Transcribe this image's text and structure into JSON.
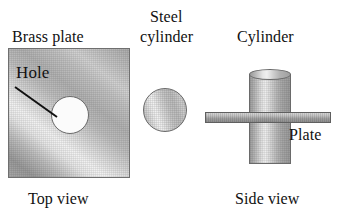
{
  "figure": {
    "background_color": "#ffffff"
  },
  "top_view": {
    "plate_label": "Brass plate",
    "hole_label": "Hole",
    "view_label": "Top view",
    "plate_fill": "#c4c4c4",
    "plate_outline": "#6f6f6f",
    "hole_fill": "#fbfbfb",
    "hole_outline": "#6a6a6a",
    "plate_rect": {
      "x": 8,
      "y": 48,
      "width": 122,
      "height": 130
    },
    "hole_circle": {
      "cx": 69,
      "cy": 114,
      "d": 38
    },
    "leader_line": {
      "x1": 10,
      "y1": 38,
      "x2": 50,
      "y2": 68
    }
  },
  "middle": {
    "cylinder_label_line1": "Steel",
    "cylinder_label_line2": "cylinder",
    "cylinder_circle": {
      "cx": 165,
      "cy": 110,
      "d": 44
    },
    "cylinder_fill": "#d0d0d0",
    "cylinder_outline": "#6a6a6a"
  },
  "side_view": {
    "cylinder_label": "Cylinder",
    "plate_label": "Plate",
    "view_label": "Side view",
    "cylinder_body": {
      "x": 249,
      "y": 74,
      "width": 42,
      "height": 90
    },
    "cylinder_top_ellipse": {
      "x": 249,
      "y": 69,
      "rx": 21,
      "ry": 5.5
    },
    "plate_bar": {
      "x": 205,
      "y": 112,
      "width": 126,
      "height": 11
    },
    "cylinder_fill": "#c8c8c8",
    "plate_fill": "#b0b0b0",
    "outline": "#6a6a6a"
  }
}
